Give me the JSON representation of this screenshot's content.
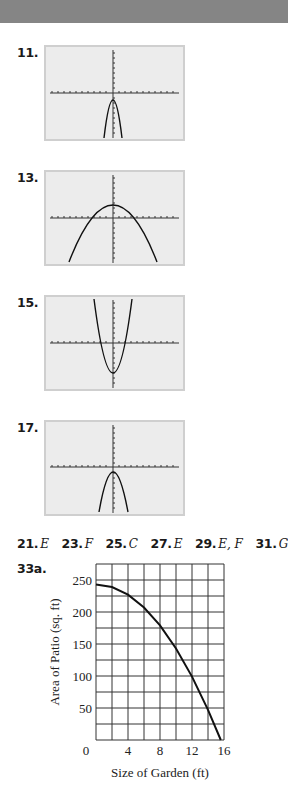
{
  "header": {
    "color": "#858585"
  },
  "exercises": [
    {
      "label": "11.",
      "graph": "downward parabola, narrow, vertex just below origin",
      "vertex": [
        0,
        -2
      ],
      "opens": "down"
    },
    {
      "label": "13.",
      "graph": "downward parabola, wide, vertex above origin",
      "vertex": [
        0,
        2
      ],
      "opens": "down"
    },
    {
      "label": "15.",
      "graph": "upward parabola, narrow, vertex below origin",
      "vertex": [
        0,
        -5
      ],
      "opens": "up"
    },
    {
      "label": "17.",
      "graph": "downward parabola, narrow, vertex just below origin",
      "vertex": [
        0,
        -1
      ],
      "opens": "down"
    }
  ],
  "answers": [
    {
      "num": "21.",
      "val": "E"
    },
    {
      "num": "23.",
      "val": "F"
    },
    {
      "num": "25.",
      "val": "C"
    },
    {
      "num": "27.",
      "val": "E"
    },
    {
      "num": "29.",
      "val": "E, F"
    },
    {
      "num": "31.",
      "val": "G"
    }
  ],
  "part_label": "33a.",
  "chart_data": {
    "type": "line",
    "title": "",
    "xlabel": "Size of Garden (ft)",
    "ylabel": "Area of Patio (sq. ft)",
    "xlim": [
      0,
      16
    ],
    "ylim": [
      0,
      275
    ],
    "xticks": [
      "0",
      "4",
      "8",
      "12",
      "16"
    ],
    "yticks": [
      "50",
      "100",
      "150",
      "200",
      "250"
    ],
    "grid": true,
    "x_grid_step": 2,
    "y_grid_step": 25,
    "series": [
      {
        "name": "Area of Patio",
        "x": [
          0,
          2,
          4,
          6,
          8,
          10,
          12,
          14,
          15.6
        ],
        "y": [
          243,
          239,
          227,
          207,
          179,
          143,
          99,
          47,
          0
        ]
      }
    ]
  }
}
